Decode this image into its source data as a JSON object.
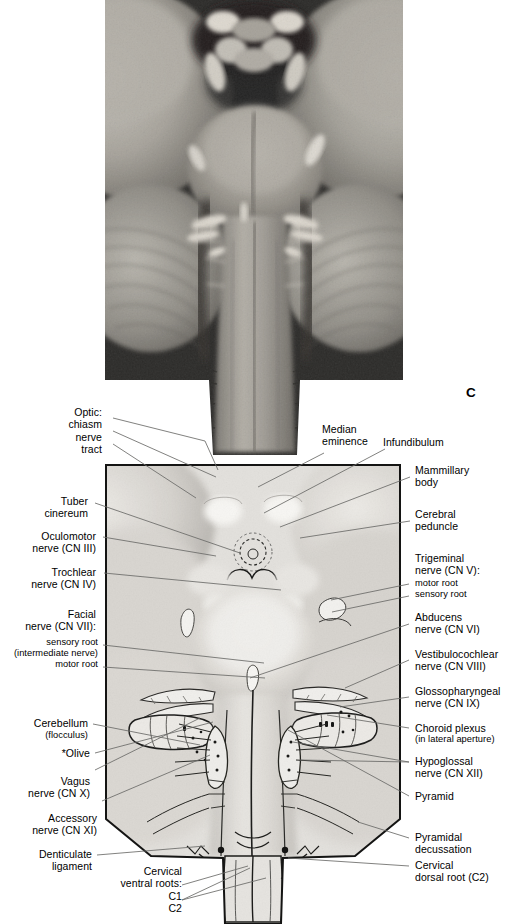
{
  "figure": {
    "panel_letter": "C",
    "background": "#ffffff"
  },
  "photo": {
    "name": "brainstem-ventral-photograph",
    "description": "Grayscale cadaveric photograph of the ventral brainstem and cerebellum"
  },
  "diagram": {
    "name": "brainstem-ventral-line-drawing"
  },
  "labels": {
    "left": [
      {
        "id": "optic",
        "lines": "Optic:\nchiasm\nnerve\ntract"
      },
      {
        "id": "tuber-cinereum",
        "lines": "Tuber\ncinereum"
      },
      {
        "id": "oculomotor",
        "lines": "Oculomotor\nnerve (CN III)"
      },
      {
        "id": "trochlear",
        "lines": "Trochlear\nnerve (CN IV)"
      },
      {
        "id": "facial",
        "lines": "Facial\nnerve (CN VII):"
      },
      {
        "id": "facial-sensory-root",
        "lines": "sensory root\n(intermediate nerve)\nmotor root"
      },
      {
        "id": "cerebellum",
        "lines": "Cerebellum"
      },
      {
        "id": "cerebellum-flocculus",
        "lines": "(flocculus)"
      },
      {
        "id": "olive",
        "lines": "*Olive"
      },
      {
        "id": "vagus",
        "lines": "Vagus\nnerve (CN X)"
      },
      {
        "id": "accessory",
        "lines": "Accessory\nnerve (CN XI)"
      },
      {
        "id": "denticulate-ligament",
        "lines": "Denticulate\nligament"
      }
    ],
    "right": [
      {
        "id": "mammillary-body",
        "lines": "Mammillary\nbody"
      },
      {
        "id": "cerebral-peduncle",
        "lines": "Cerebral\npeduncle"
      },
      {
        "id": "trigeminal",
        "lines": "Trigeminal\nnerve (CN V):"
      },
      {
        "id": "trigeminal-roots",
        "lines": "motor root\nsensory root"
      },
      {
        "id": "abducens",
        "lines": "Abducens\nnerve (CN VI)"
      },
      {
        "id": "vestibulocochlear",
        "lines": "Vestibulocochlear\nnerve (CN VIII)"
      },
      {
        "id": "glossopharyngeal",
        "lines": "Glossopharyngeal\nnerve (CN IX)"
      },
      {
        "id": "choroid-plexus",
        "lines": "Choroid plexus"
      },
      {
        "id": "choroid-plexus-detail",
        "lines": "(in lateral aperture)"
      },
      {
        "id": "hypoglossal",
        "lines": "Hypoglossal\nnerve (CN XII)"
      },
      {
        "id": "pyramid",
        "lines": "Pyramid"
      },
      {
        "id": "pyramidal-decussation",
        "lines": "Pyramidal\ndecussation"
      },
      {
        "id": "cervical-dorsal-root",
        "lines": "Cervical\ndorsal root (C2)"
      }
    ],
    "top": [
      {
        "id": "median-eminence",
        "lines": "Median\neminence"
      },
      {
        "id": "infundibulum",
        "lines": "Infundibulum"
      }
    ],
    "bottom": [
      {
        "id": "cervical-ventral-roots",
        "lines": "Cervical\nventral roots:"
      },
      {
        "id": "cervical-ventral-root-c1",
        "lines": "C1"
      },
      {
        "id": "cervical-ventral-root-c2",
        "lines": "C2"
      }
    ]
  }
}
